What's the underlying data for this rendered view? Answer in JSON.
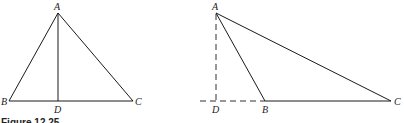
{
  "figure": {
    "caption": "Figure 12.25",
    "left_diagram": {
      "description": "Acute triangle ABC with altitude AD drawn inside to base BC",
      "labels": {
        "A": "A",
        "B": "B",
        "C": "C",
        "D": "D"
      }
    },
    "right_diagram": {
      "description": "Obtuse triangle ABC with altitude AD falling outside; base CB extended (dashed) to D",
      "labels": {
        "A": "A",
        "B": "B",
        "C": "C",
        "D": "D"
      }
    },
    "colors": {
      "stroke": "#1a1a1a",
      "text": "#222222",
      "background": "#ffffff"
    }
  }
}
